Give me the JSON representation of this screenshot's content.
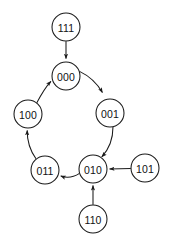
{
  "diagram": {
    "type": "state-transition-graph",
    "title": "",
    "style": {
      "background_color": "#ffffff",
      "node_fill": "#ffffff",
      "node_stroke": "#1a1a1a",
      "edge_color": "#1a1a1a",
      "label_color": "#111111",
      "node_radius": 14,
      "stroke_width": 1.05
    },
    "nodes": [
      {
        "id": "111",
        "label": "111",
        "cx": 66,
        "cy": 27,
        "r": 14
      },
      {
        "id": "000",
        "label": "000",
        "cx": 66,
        "cy": 76,
        "r": 14
      },
      {
        "id": "100",
        "label": "100",
        "cx": 28,
        "cy": 114,
        "r": 14
      },
      {
        "id": "001",
        "label": "001",
        "cx": 110,
        "cy": 113,
        "r": 14
      },
      {
        "id": "011",
        "label": "011",
        "cx": 45,
        "cy": 170,
        "r": 14
      },
      {
        "id": "010",
        "label": "010",
        "cx": 93,
        "cy": 169,
        "r": 14
      },
      {
        "id": "101",
        "label": "101",
        "cx": 145,
        "cy": 168,
        "r": 14
      },
      {
        "id": "110",
        "label": "110",
        "cx": 93,
        "cy": 219,
        "r": 14
      }
    ],
    "edges": [
      {
        "id": "e-111-000",
        "from": "111",
        "to": "000",
        "shape": "straight",
        "path": "M 66 41.2 L 66 58.6",
        "arrow": true
      },
      {
        "id": "e-100-000",
        "from": "100",
        "to": "000",
        "shape": "curved",
        "path": "M 36.0 104.2 Q 44.5 88.0 50.9 81.3",
        "arrow": true
      },
      {
        "id": "e-000-001",
        "from": "000",
        "to": "001",
        "shape": "curved",
        "path": "M 79.1 71.1 Q 94.5 78.5 102.4 92.5",
        "arrow": true
      },
      {
        "id": "e-001-010",
        "from": "001",
        "to": "010",
        "shape": "curved",
        "path": "M 113.0 126.8 Q 113.0 145.0 101.8 156.8",
        "arrow": true
      },
      {
        "id": "e-010-011",
        "from": "010",
        "to": "011",
        "shape": "curved",
        "path": "M 79.5 173.4 Q 70.0 179.5 60.8 176.0",
        "arrow": true
      },
      {
        "id": "e-011-100",
        "from": "011",
        "to": "100",
        "shape": "curved",
        "path": "M 36.0 158.7 Q 27.0 146.0 27.2 130.4",
        "arrow": true
      },
      {
        "id": "e-101-010",
        "from": "101",
        "to": "010",
        "shape": "straight",
        "path": "M 130.8 168.4 L 109.6 168.9",
        "arrow": true
      },
      {
        "id": "e-110-010",
        "from": "110",
        "to": "010",
        "shape": "straight",
        "path": "M 93 204.8 L 93 185.6",
        "arrow": true
      }
    ],
    "cycle": [
      "000",
      "001",
      "010",
      "011",
      "100"
    ],
    "transient_states": [
      "111",
      "101",
      "110"
    ]
  }
}
